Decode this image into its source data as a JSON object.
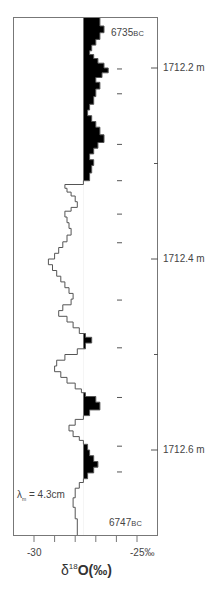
{
  "chart_data": {
    "type": "line",
    "orientation": "vertical-profile",
    "title": "",
    "xlabel": "δ18O(‰)",
    "xlabel_parts": {
      "delta": "δ",
      "sup": "18",
      "main": "O(‰)"
    },
    "ylabel": "Depth (m)",
    "xlim": [
      -31.0,
      -24.0
    ],
    "ylim": [
      1712.147,
      1712.69
    ],
    "x_ticks": [
      -30,
      -29,
      -28,
      -27,
      -26,
      -25
    ],
    "x_tick_labels": [
      {
        "value": -30,
        "label": "-30"
      },
      {
        "value": -25,
        "label": "-25‰"
      }
    ],
    "y_ticks": [
      1712.2,
      1712.3,
      1712.4,
      1712.5,
      1712.6
    ],
    "y_tick_labels": [
      {
        "value": 1712.2,
        "label": "1712.2 m"
      },
      {
        "value": 1712.4,
        "label": "1712.4 m"
      },
      {
        "value": 1712.6,
        "label": "1712.6 m"
      }
    ],
    "fill_threshold": -27.6,
    "fill_side": "above-threshold (less negative), black",
    "annotations": [
      {
        "text": "6735",
        "suffix": "BC",
        "position": "top-right"
      },
      {
        "text": "6747",
        "suffix": "BC",
        "position": "bottom-right"
      },
      {
        "text": "λm = 4.3cm",
        "position": "bottom-left"
      }
    ],
    "marker_dashes_depth_m": [
      1712.201,
      1712.227,
      1712.28,
      1712.318,
      1712.353,
      1712.383,
      1712.443,
      1712.493,
      1712.545,
      1712.596,
      1712.623
    ],
    "series": [
      {
        "name": "δ18O",
        "style": "stepped",
        "points": [
          [
            1712.147,
            -26.8
          ],
          [
            1712.156,
            -26.8
          ],
          [
            1712.156,
            -26.6
          ],
          [
            1712.163,
            -26.6
          ],
          [
            1712.163,
            -26.8
          ],
          [
            1712.17,
            -26.8
          ],
          [
            1712.17,
            -27.0
          ],
          [
            1712.176,
            -27.0
          ],
          [
            1712.176,
            -27.2
          ],
          [
            1712.182,
            -27.2
          ],
          [
            1712.182,
            -27.3
          ],
          [
            1712.186,
            -27.3
          ],
          [
            1712.186,
            -27.1
          ],
          [
            1712.19,
            -27.1
          ],
          [
            1712.19,
            -26.9
          ],
          [
            1712.195,
            -26.9
          ],
          [
            1712.195,
            -26.6
          ],
          [
            1712.2,
            -26.6
          ],
          [
            1712.2,
            -26.4
          ],
          [
            1712.205,
            -26.4
          ],
          [
            1712.205,
            -26.7
          ],
          [
            1712.21,
            -26.7
          ],
          [
            1712.21,
            -27.0
          ],
          [
            1712.215,
            -27.0
          ],
          [
            1712.215,
            -26.8
          ],
          [
            1712.222,
            -26.8
          ],
          [
            1712.222,
            -27.0
          ],
          [
            1712.23,
            -27.0
          ],
          [
            1712.23,
            -27.1
          ],
          [
            1712.238,
            -27.1
          ],
          [
            1712.238,
            -27.3
          ],
          [
            1712.244,
            -27.3
          ],
          [
            1712.244,
            -27.4
          ],
          [
            1712.25,
            -27.4
          ],
          [
            1712.25,
            -27.2
          ],
          [
            1712.256,
            -27.2
          ],
          [
            1712.256,
            -27.0
          ],
          [
            1712.262,
            -27.0
          ],
          [
            1712.262,
            -26.8
          ],
          [
            1712.27,
            -26.8
          ],
          [
            1712.27,
            -26.6
          ],
          [
            1712.278,
            -26.6
          ],
          [
            1712.278,
            -26.9
          ],
          [
            1712.284,
            -26.9
          ],
          [
            1712.284,
            -27.1
          ],
          [
            1712.29,
            -27.1
          ],
          [
            1712.29,
            -27.3
          ],
          [
            1712.296,
            -27.3
          ],
          [
            1712.296,
            -27.1
          ],
          [
            1712.302,
            -27.1
          ],
          [
            1712.302,
            -27.2
          ],
          [
            1712.31,
            -27.2
          ],
          [
            1712.31,
            -27.3
          ],
          [
            1712.318,
            -27.3
          ],
          [
            1712.318,
            -27.6
          ],
          [
            1712.322,
            -27.6
          ],
          [
            1712.322,
            -28.5
          ],
          [
            1712.326,
            -28.5
          ],
          [
            1712.326,
            -28.4
          ],
          [
            1712.33,
            -28.4
          ],
          [
            1712.33,
            -28.2
          ],
          [
            1712.334,
            -28.2
          ],
          [
            1712.334,
            -28.0
          ],
          [
            1712.34,
            -28.0
          ],
          [
            1712.34,
            -27.9
          ],
          [
            1712.346,
            -27.9
          ],
          [
            1712.346,
            -28.2
          ],
          [
            1712.35,
            -28.2
          ],
          [
            1712.35,
            -28.5
          ],
          [
            1712.356,
            -28.5
          ],
          [
            1712.356,
            -28.4
          ],
          [
            1712.362,
            -28.4
          ],
          [
            1712.362,
            -28.3
          ],
          [
            1712.368,
            -28.3
          ],
          [
            1712.368,
            -28.2
          ],
          [
            1712.375,
            -28.2
          ],
          [
            1712.375,
            -28.4
          ],
          [
            1712.382,
            -28.4
          ],
          [
            1712.382,
            -28.6
          ],
          [
            1712.388,
            -28.6
          ],
          [
            1712.388,
            -28.8
          ],
          [
            1712.394,
            -28.8
          ],
          [
            1712.394,
            -29.0
          ],
          [
            1712.4,
            -29.0
          ],
          [
            1712.4,
            -29.3
          ],
          [
            1712.406,
            -29.3
          ],
          [
            1712.406,
            -29.1
          ],
          [
            1712.412,
            -29.1
          ],
          [
            1712.412,
            -28.9
          ],
          [
            1712.418,
            -28.9
          ],
          [
            1712.418,
            -28.7
          ],
          [
            1712.424,
            -28.7
          ],
          [
            1712.424,
            -28.5
          ],
          [
            1712.43,
            -28.5
          ],
          [
            1712.43,
            -28.3
          ],
          [
            1712.436,
            -28.3
          ],
          [
            1712.436,
            -28.1
          ],
          [
            1712.442,
            -28.1
          ],
          [
            1712.442,
            -28.2
          ],
          [
            1712.448,
            -28.2
          ],
          [
            1712.448,
            -28.6
          ],
          [
            1712.454,
            -28.6
          ],
          [
            1712.454,
            -28.8
          ],
          [
            1712.46,
            -28.8
          ],
          [
            1712.46,
            -28.4
          ],
          [
            1712.466,
            -28.4
          ],
          [
            1712.466,
            -28.1
          ],
          [
            1712.472,
            -28.1
          ],
          [
            1712.472,
            -27.8
          ],
          [
            1712.478,
            -27.8
          ],
          [
            1712.478,
            -27.5
          ],
          [
            1712.482,
            -27.5
          ],
          [
            1712.482,
            -27.2
          ],
          [
            1712.488,
            -27.2
          ],
          [
            1712.488,
            -27.5
          ],
          [
            1712.494,
            -27.5
          ],
          [
            1712.494,
            -27.9
          ],
          [
            1712.5,
            -27.9
          ],
          [
            1712.5,
            -28.5
          ],
          [
            1712.506,
            -28.5
          ],
          [
            1712.506,
            -28.9
          ],
          [
            1712.512,
            -28.9
          ],
          [
            1712.512,
            -29.0
          ],
          [
            1712.518,
            -29.0
          ],
          [
            1712.518,
            -28.7
          ],
          [
            1712.524,
            -28.7
          ],
          [
            1712.524,
            -28.4
          ],
          [
            1712.53,
            -28.4
          ],
          [
            1712.53,
            -28.0
          ],
          [
            1712.536,
            -28.0
          ],
          [
            1712.536,
            -27.7
          ],
          [
            1712.54,
            -27.7
          ],
          [
            1712.54,
            -27.5
          ],
          [
            1712.544,
            -27.5
          ],
          [
            1712.544,
            -27.0
          ],
          [
            1712.55,
            -27.0
          ],
          [
            1712.55,
            -26.8
          ],
          [
            1712.558,
            -26.8
          ],
          [
            1712.558,
            -27.3
          ],
          [
            1712.564,
            -27.3
          ],
          [
            1712.564,
            -27.6
          ],
          [
            1712.568,
            -27.6
          ],
          [
            1712.568,
            -28.0
          ],
          [
            1712.574,
            -28.0
          ],
          [
            1712.574,
            -28.3
          ],
          [
            1712.58,
            -28.3
          ],
          [
            1712.58,
            -28.1
          ],
          [
            1712.586,
            -28.1
          ],
          [
            1712.586,
            -27.8
          ],
          [
            1712.59,
            -27.8
          ],
          [
            1712.59,
            -27.6
          ],
          [
            1712.594,
            -27.6
          ],
          [
            1712.594,
            -27.4
          ],
          [
            1712.6,
            -27.4
          ],
          [
            1712.6,
            -27.3
          ],
          [
            1712.606,
            -27.3
          ],
          [
            1712.606,
            -27.1
          ],
          [
            1712.612,
            -27.1
          ],
          [
            1712.612,
            -26.9
          ],
          [
            1712.618,
            -26.9
          ],
          [
            1712.618,
            -27.1
          ],
          [
            1712.624,
            -27.1
          ],
          [
            1712.624,
            -27.4
          ],
          [
            1712.63,
            -27.4
          ],
          [
            1712.63,
            -27.6
          ],
          [
            1712.634,
            -27.6
          ],
          [
            1712.634,
            -27.8
          ],
          [
            1712.64,
            -27.8
          ],
          [
            1712.64,
            -28.0
          ],
          [
            1712.65,
            -28.0
          ],
          [
            1712.65,
            -28.1
          ],
          [
            1712.66,
            -28.1
          ],
          [
            1712.66,
            -28.0
          ],
          [
            1712.672,
            -28.0
          ],
          [
            1712.672,
            -27.9
          ],
          [
            1712.69,
            -27.9
          ]
        ]
      }
    ]
  },
  "labels": {
    "top_date": "6735",
    "top_date_suffix": "BC",
    "bottom_date": "6747",
    "bottom_date_suffix": "BC",
    "lambda_symbol": "λ",
    "lambda_sub": "m",
    "lambda_value": " = 4.3cm",
    "depth_1": "1712.2 m",
    "depth_2": "1712.4 m",
    "depth_3": "1712.6 m",
    "x_left": "-30",
    "x_right": "-25‰",
    "xlabel_delta": "δ",
    "xlabel_sup": "18",
    "xlabel_main": "O(‰)"
  },
  "colors": {
    "frame": "#777777",
    "line": "#555555",
    "fill": "#000000",
    "text": "#444444"
  }
}
